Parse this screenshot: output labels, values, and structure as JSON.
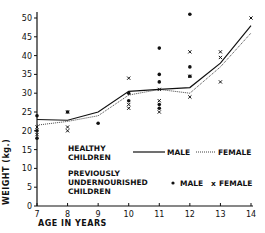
{
  "chart_data": {
    "type": "line+scatter",
    "title": "",
    "xlabel": "AGE IN YEARS",
    "ylabel": "WEIGHT (kg.)",
    "xlim": [
      7,
      14
    ],
    "ylim": [
      0,
      50
    ],
    "x_ticks": [
      7,
      8,
      9,
      10,
      11,
      12,
      13,
      14
    ],
    "y_ticks": [
      0,
      5,
      10,
      15,
      20,
      25,
      30,
      35,
      40,
      45,
      50
    ],
    "grid": false,
    "legend": {
      "group1_label": [
        "HEALTHY",
        "CHILDREN"
      ],
      "group2_label": [
        "PREVIOUSLY",
        "UNDERNOURISHED",
        "CHILDREN"
      ],
      "entries": [
        {
          "group": "HEALTHY CHILDREN",
          "marker": "solid-line",
          "label": "MALE"
        },
        {
          "group": "HEALTHY CHILDREN",
          "marker": "dotted-line",
          "label": "FEMALE"
        },
        {
          "group": "PREVIOUSLY UNDERNOURISHED CHILDREN",
          "marker": "dot",
          "label": "MALE"
        },
        {
          "group": "PREVIOUSLY UNDERNOURISHED CHILDREN",
          "marker": "cross",
          "label": "FEMALE"
        }
      ],
      "position": "lower-center"
    },
    "x": [
      7,
      8,
      9,
      10,
      11,
      12,
      13,
      14
    ],
    "series": [
      {
        "name": "Healthy children - MALE",
        "style": "solid",
        "values": [
          23,
          22.8,
          25,
          30.5,
          31,
          31.5,
          38,
          48
        ]
      },
      {
        "name": "Healthy children - FEMALE",
        "style": "dotted",
        "values": [
          21.5,
          22.5,
          24,
          29.5,
          31,
          30,
          37,
          46
        ]
      }
    ],
    "scatter": [
      {
        "name": "Previously undernourished - MALE",
        "marker": "dot",
        "points": [
          [
            7,
            24
          ],
          [
            7,
            20
          ],
          [
            7,
            18
          ],
          [
            8,
            25
          ],
          [
            9,
            22
          ],
          [
            10,
            30
          ],
          [
            10,
            28
          ],
          [
            11,
            42
          ],
          [
            11,
            35
          ],
          [
            11,
            33
          ],
          [
            11,
            27
          ],
          [
            11,
            26
          ],
          [
            12,
            51
          ],
          [
            12,
            37
          ],
          [
            12,
            34.5
          ]
        ]
      },
      {
        "name": "Previously undernourished - FEMALE",
        "marker": "cross",
        "points": [
          [
            7,
            21
          ],
          [
            7,
            19
          ],
          [
            8,
            25
          ],
          [
            8,
            21
          ],
          [
            8,
            20
          ],
          [
            10,
            34
          ],
          [
            10,
            27
          ],
          [
            10,
            26
          ],
          [
            11,
            31
          ],
          [
            11,
            28
          ],
          [
            11,
            25
          ],
          [
            12,
            41
          ],
          [
            12,
            34.5
          ],
          [
            12,
            29
          ],
          [
            13,
            41
          ],
          [
            13,
            39.5
          ],
          [
            13,
            33
          ],
          [
            14,
            50
          ]
        ]
      }
    ]
  },
  "labels": {
    "x_axis_title": "AGE IN YEARS",
    "y_axis_title": "WEIGHT (kg.)",
    "legend_healthy_1": "HEALTHY",
    "legend_healthy_2": "CHILDREN",
    "legend_prev_1": "PREVIOUSLY",
    "legend_prev_2": "UNDERNOURISHED",
    "legend_prev_3": "CHILDREN",
    "legend_male": "MALE",
    "legend_female": "FEMALE"
  }
}
